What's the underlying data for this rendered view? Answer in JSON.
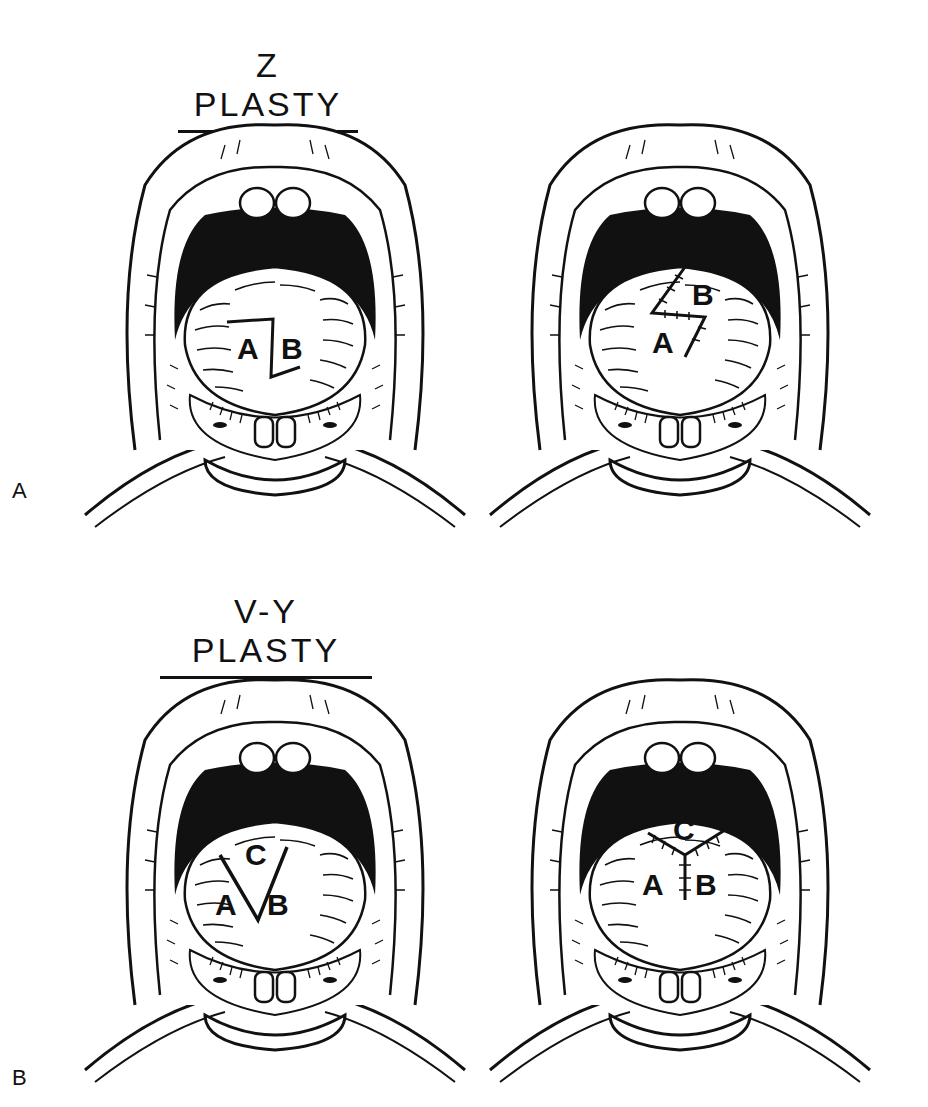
{
  "figure": {
    "panels": [
      {
        "id": "A",
        "panel_label": "A",
        "title": "Z PLASTY",
        "drawings": [
          {
            "state": "incision",
            "flap_labels": [
              "A",
              "B"
            ]
          },
          {
            "state": "sutured",
            "flap_labels": [
              "B",
              "A"
            ]
          }
        ]
      },
      {
        "id": "B",
        "panel_label": "B",
        "title": "V-Y PLASTY",
        "drawings": [
          {
            "state": "incision",
            "flap_labels": [
              "C",
              "A",
              "B"
            ]
          },
          {
            "state": "sutured",
            "flap_labels": [
              "C",
              "A",
              "B"
            ]
          }
        ]
      }
    ]
  },
  "colors": {
    "ink": "#111111",
    "paper": "#ffffff"
  }
}
